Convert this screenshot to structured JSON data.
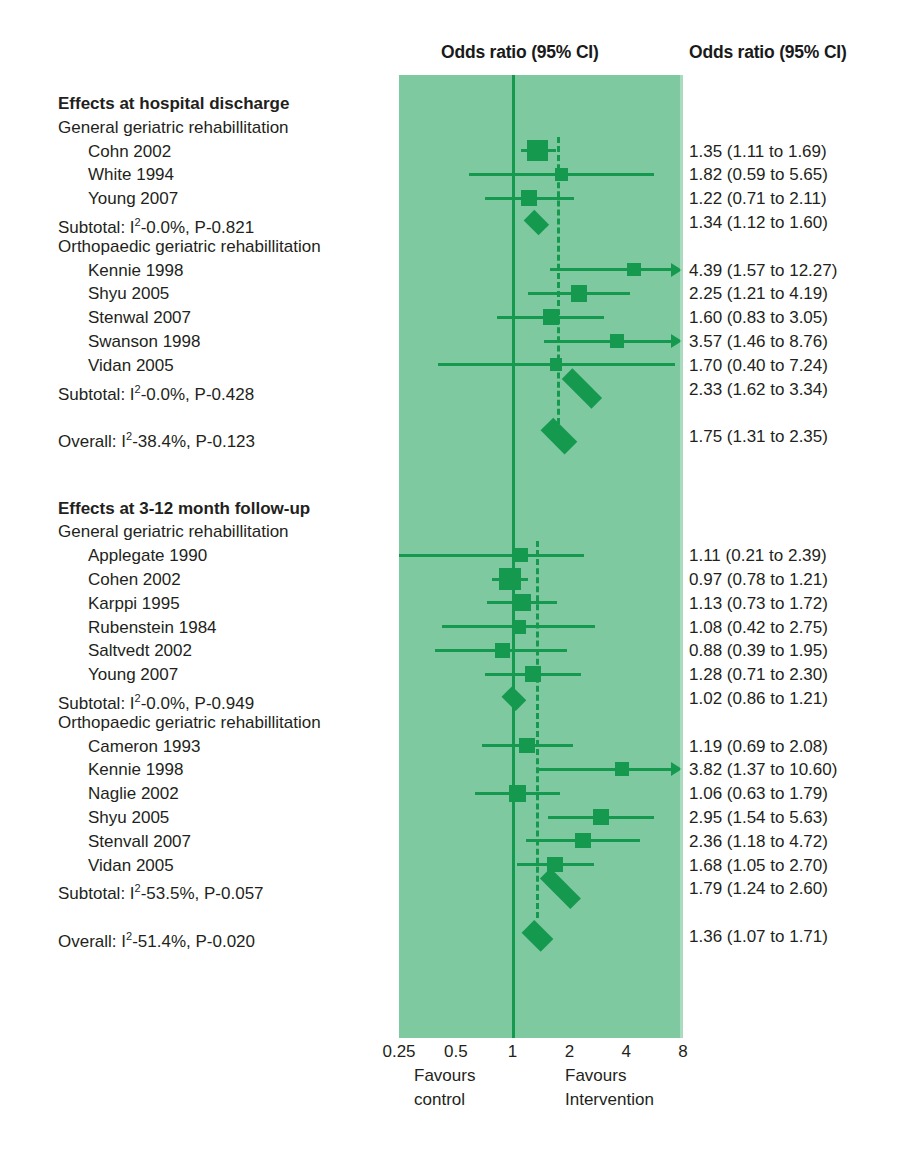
{
  "headers": {
    "plot_column": "Odds ratio (95% CI)",
    "result_column": "Odds ratio (95% CI)"
  },
  "axis": {
    "ticks": [
      "0.25",
      "0.5",
      "1",
      "2",
      "4",
      "8"
    ],
    "tick_values": [
      0.25,
      0.5,
      1,
      2,
      4,
      8
    ],
    "favours_left_line1": "Favours",
    "favours_left_line2": "control",
    "favours_right_line1": "Favours",
    "favours_right_line2": "Intervention",
    "scale": "log",
    "xmin": 0.25,
    "xmax": 8
  },
  "colors": {
    "panel_background": "#7ec99f",
    "marker_green": "#15994e",
    "text": "#231f20",
    "page_background": "#ffffff"
  },
  "chart_data": {
    "type": "forest",
    "title": "Odds ratio (95% CI)",
    "xlabel": "Odds ratio (95% CI)",
    "ylabel": "",
    "xlim": [
      0.25,
      8
    ],
    "xscale": "log",
    "xticks": [
      0.25,
      0.5,
      1,
      2,
      4,
      8
    ],
    "null_value": 1,
    "grid": false,
    "legend": "none",
    "annotations": [
      "Favours control",
      "Favours Intervention"
    ],
    "rows": [
      {
        "kind": "section",
        "label": "Effects at hospital discharge"
      },
      {
        "kind": "group",
        "label": "General geriatric rehabillitation"
      },
      {
        "kind": "study",
        "label": "Cohn 2002",
        "result": "1.35 (1.11 to 1.69)",
        "or": 1.35,
        "lo": 1.11,
        "hi": 1.69,
        "weight": 0.85,
        "arrow_right": false
      },
      {
        "kind": "study",
        "label": "White 1994",
        "result": "1.82 (0.59 to 5.65)",
        "or": 1.82,
        "lo": 0.59,
        "hi": 5.65,
        "weight": 0.28,
        "arrow_right": false
      },
      {
        "kind": "study",
        "label": "Young 2007",
        "result": "1.22 (0.71 to 2.11)",
        "or": 1.22,
        "lo": 0.71,
        "hi": 2.11,
        "weight": 0.48,
        "arrow_right": false
      },
      {
        "kind": "subtotal",
        "label": "Subtotal: I²-0.0%, P-0.821",
        "result": "1.34 (1.12 to 1.60)",
        "or": 1.34,
        "lo": 1.12,
        "hi": 1.6
      },
      {
        "kind": "group",
        "label": "Orthopaedic geriatric rehabillitation"
      },
      {
        "kind": "study",
        "label": "Kennie 1998",
        "result": "4.39 (1.57 to 12.27)",
        "or": 4.39,
        "lo": 1.57,
        "hi": 12.27,
        "weight": 0.34,
        "arrow_right": true
      },
      {
        "kind": "study",
        "label": "Shyu 2005",
        "result": "2.25 (1.21 to 4.19)",
        "or": 2.25,
        "lo": 1.21,
        "hi": 4.19,
        "weight": 0.52,
        "arrow_right": false
      },
      {
        "kind": "study",
        "label": "Stenwal 2007",
        "result": "1.60 (0.83 to 3.05)",
        "or": 1.6,
        "lo": 0.83,
        "hi": 3.05,
        "weight": 0.5,
        "arrow_right": false
      },
      {
        "kind": "study",
        "label": "Swanson 1998",
        "result": "3.57 (1.46 to 8.76)",
        "or": 3.57,
        "lo": 1.46,
        "hi": 8.76,
        "weight": 0.4,
        "arrow_right": true
      },
      {
        "kind": "study",
        "label": "Vidan 2005",
        "result": "1.70 (0.40 to 7.24)",
        "or": 1.7,
        "lo": 0.4,
        "hi": 7.24,
        "weight": 0.26,
        "arrow_right": false
      },
      {
        "kind": "subtotal",
        "label": "Subtotal: I²-0.0%, P-0.428",
        "result": "2.33 (1.62 to 3.34)",
        "or": 2.33,
        "lo": 1.62,
        "hi": 3.34
      },
      {
        "kind": "spacer"
      },
      {
        "kind": "overall",
        "label": "Overall: I²-38.4%, P-0.123",
        "result": "1.75 (1.31 to 2.35)",
        "or": 1.75,
        "lo": 1.31,
        "hi": 2.35
      },
      {
        "kind": "spacer"
      },
      {
        "kind": "spacer"
      },
      {
        "kind": "section",
        "label": "Effects at 3-12 month follow-up"
      },
      {
        "kind": "group",
        "label": "General geriatric rehabillitation"
      },
      {
        "kind": "study",
        "label": "Applegate 1990",
        "result": "1.11 (0.21 to 2.39)",
        "or": 1.11,
        "lo": 0.21,
        "hi": 2.39,
        "weight": 0.35,
        "arrow_right": false
      },
      {
        "kind": "study",
        "label": "Cohen 2002",
        "result": "0.97 (0.78 to 1.21)",
        "or": 0.97,
        "lo": 0.78,
        "hi": 1.21,
        "weight": 0.9,
        "arrow_right": false
      },
      {
        "kind": "study",
        "label": "Karppi 1995",
        "result": "1.13 (0.73 to 1.72)",
        "or": 1.13,
        "lo": 0.73,
        "hi": 1.72,
        "weight": 0.6,
        "arrow_right": false
      },
      {
        "kind": "study",
        "label": "Rubenstein 1984",
        "result": "1.08 (0.42 to 2.75)",
        "or": 1.08,
        "lo": 0.42,
        "hi": 2.75,
        "weight": 0.35,
        "arrow_right": false
      },
      {
        "kind": "study",
        "label": "Saltvedt 2002",
        "result": "0.88 (0.39 to 1.95)",
        "or": 0.88,
        "lo": 0.39,
        "hi": 1.95,
        "weight": 0.42,
        "arrow_right": false
      },
      {
        "kind": "study",
        "label": "Young 2007",
        "result": "1.28 (0.71 to 2.30)",
        "or": 1.28,
        "lo": 0.71,
        "hi": 2.3,
        "weight": 0.5,
        "arrow_right": false
      },
      {
        "kind": "subtotal",
        "label": "Subtotal: I²-0.0%, P-0.949",
        "result": "1.02 (0.86 to 1.21)",
        "or": 1.02,
        "lo": 0.86,
        "hi": 1.21
      },
      {
        "kind": "group",
        "label": "Orthopaedic geriatric rehabillitation"
      },
      {
        "kind": "study",
        "label": "Cameron 1993",
        "result": "1.19 (0.69 to 2.08)",
        "or": 1.19,
        "lo": 0.69,
        "hi": 2.08,
        "weight": 0.45,
        "arrow_right": false
      },
      {
        "kind": "study",
        "label": "Kennie 1998",
        "result": "3.82 (1.37 to 10.60)",
        "or": 3.82,
        "lo": 1.37,
        "hi": 10.6,
        "weight": 0.35,
        "arrow_right": true
      },
      {
        "kind": "study",
        "label": "Naglie 2002",
        "result": "1.06 (0.63 to 1.79)",
        "or": 1.06,
        "lo": 0.63,
        "hi": 1.79,
        "weight": 0.55,
        "arrow_right": false
      },
      {
        "kind": "study",
        "label": "Shyu 2005",
        "result": "2.95 (1.54 to 5.63)",
        "or": 2.95,
        "lo": 1.54,
        "hi": 5.63,
        "weight": 0.48,
        "arrow_right": false
      },
      {
        "kind": "study",
        "label": "Stenvall 2007",
        "result": "2.36 (1.18 to 4.72)",
        "or": 2.36,
        "lo": 1.18,
        "hi": 4.72,
        "weight": 0.45,
        "arrow_right": false
      },
      {
        "kind": "study",
        "label": "Vidan 2005",
        "result": "1.68 (1.05 to 2.70)",
        "or": 1.68,
        "lo": 1.05,
        "hi": 2.7,
        "weight": 0.45,
        "arrow_right": false
      },
      {
        "kind": "subtotal",
        "label": "Subtotal: I²-53.5%, P-0.057",
        "result": "1.79 (1.24 to 2.60)",
        "or": 1.79,
        "lo": 1.24,
        "hi": 2.6
      },
      {
        "kind": "spacer"
      },
      {
        "kind": "overall",
        "label": "Overall: I²-51.4%, P-0.020",
        "result": "1.36 (1.07 to 1.71)",
        "or": 1.36,
        "lo": 1.07,
        "hi": 1.71
      }
    ],
    "reference_lines": [
      {
        "value": 1,
        "style": "solid"
      },
      {
        "value": 1.75,
        "style": "dashed",
        "segment": "discharge"
      },
      {
        "value": 1.36,
        "style": "dashed",
        "segment": "followup"
      }
    ]
  }
}
